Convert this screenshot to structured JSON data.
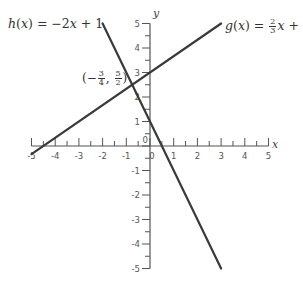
{
  "chart_data": {
    "type": "line",
    "title": "",
    "xlabel": "x",
    "ylabel": "y",
    "xlim": [
      -5,
      5
    ],
    "ylim": [
      -5,
      5
    ],
    "grid": false,
    "x_ticks": [
      -5,
      -4,
      -3,
      -2,
      -1,
      0,
      1,
      2,
      3,
      4,
      5
    ],
    "y_ticks": [
      -5,
      -4,
      -3,
      -2,
      -1,
      1,
      2,
      3,
      4,
      5
    ],
    "minor_ticks_per_unit": 2,
    "series": [
      {
        "name": "h(x) = -2x + 1",
        "label_parts": {
          "fn": "h",
          "var": "x",
          "rhs": "= −2",
          "rest": " + 1"
        },
        "slope": -2,
        "intercept": 1,
        "x": [
          -2,
          3
        ],
        "y": [
          5,
          -5
        ],
        "color": "#3a3a3a"
      },
      {
        "name": "g(x) = 2/3 x + 3",
        "label_parts": {
          "fn": "g",
          "var": "x",
          "num": "2",
          "den": "3",
          "rest": " + 3"
        },
        "slope": 0.6667,
        "intercept": 3,
        "x": [
          -5,
          3
        ],
        "y": [
          -0.333,
          5
        ],
        "color": "#3a3a3a"
      }
    ],
    "annotations": [
      {
        "text": "(-3/4, 5/2)",
        "x": -0.75,
        "y": 2.5,
        "parts": {
          "open": "(−",
          "xnum": "3",
          "xden": "4",
          "sep": ",",
          "ynum": "5",
          "yden": "2",
          "close": ")"
        }
      }
    ]
  }
}
